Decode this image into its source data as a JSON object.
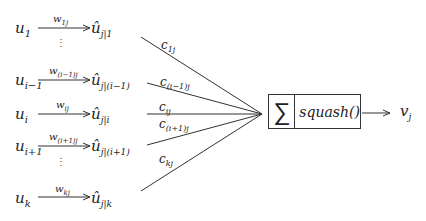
{
  "diagram": {
    "title": "",
    "inputs": [
      {
        "u": "u",
        "u_sub": "1",
        "w": "w",
        "w_sub": "1j",
        "uhat": "û",
        "uhat_sub": "j|1",
        "y": 28
      },
      {
        "u": "u",
        "u_sub": "i−1",
        "w": "w",
        "w_sub": "(i−1)j",
        "uhat": "û",
        "uhat_sub": "j|(i−1)",
        "y": 80
      },
      {
        "u": "u",
        "u_sub": "i",
        "w": "w",
        "w_sub": "ij",
        "uhat": "û",
        "uhat_sub": "j|i",
        "y": 114
      },
      {
        "u": "u",
        "u_sub": "i+1",
        "w": "w",
        "w_sub": "(i+1)j",
        "uhat": "û",
        "uhat_sub": "j|(i+1)",
        "y": 146
      },
      {
        "u": "u",
        "u_sub": "k",
        "w": "w",
        "w_sub": "kj",
        "uhat": "û",
        "uhat_sub": "j|k",
        "y": 198
      }
    ],
    "ellipsis": "⋮",
    "coupling": [
      {
        "c": "c",
        "c_sub": "1j"
      },
      {
        "c": "c",
        "c_sub": "(i−1)j"
      },
      {
        "c": "c",
        "c_sub": "ij"
      },
      {
        "c": "c",
        "c_sub": "(i+1)j"
      },
      {
        "c": "c",
        "c_sub": "kj"
      }
    ],
    "box": {
      "sum_symbol": "∑",
      "function_label": "squash()"
    },
    "output": {
      "v": "v",
      "v_sub": "j"
    },
    "colors": {
      "line": "#333333",
      "text": "#222222",
      "background": "#ffffff"
    }
  }
}
